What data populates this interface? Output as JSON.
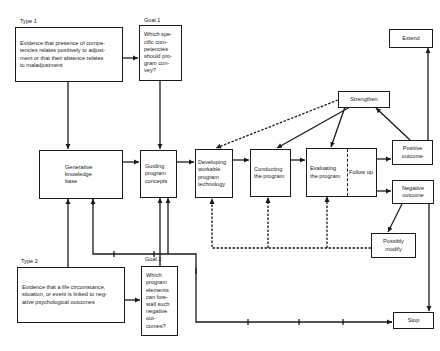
{
  "diagram": {
    "type_1": {
      "label": "Type 1",
      "text": "Evidence that presence of compe-\ntencies relates positively to adjust-\nment or that their absence relates\nto maladjustment"
    },
    "goal_1": {
      "label": "Goal 1",
      "text": "Which spe-\ncific com-\npetencies\nshould pro-\ngram con-\nvey?"
    },
    "type_2": {
      "label": "Type 2",
      "text": "Evidence that a life circumstance,\nsituation, or event is linked to neg-\native psychological outcomes"
    },
    "goal_2": {
      "label": "Goal 2",
      "text": "Which\nprogram\nelements\ncan fore-\nstall such\nnegative\nout-\ncomes?"
    },
    "generative": {
      "text": "Generative\nknowledge\nbase"
    },
    "guiding": {
      "text": "Guiding\nprogram\nconcepts"
    },
    "developing": {
      "text": "Developing\nworkable\nprogram\ntechnology"
    },
    "conducting": {
      "text": "Conducting\nthe program"
    },
    "evaluating": {
      "text": "Evaluating\nthe program"
    },
    "follow_up": {
      "text": "Follow up"
    },
    "strengthen": {
      "text": "Strengthen"
    },
    "extend": {
      "text": "Extend"
    },
    "positive": {
      "text": "Positive\noutcome"
    },
    "negative": {
      "text": "Negative\noutcome"
    },
    "possibly_modify": {
      "text": "Possibly\nmodify"
    },
    "stop": {
      "text": "Stop"
    }
  }
}
